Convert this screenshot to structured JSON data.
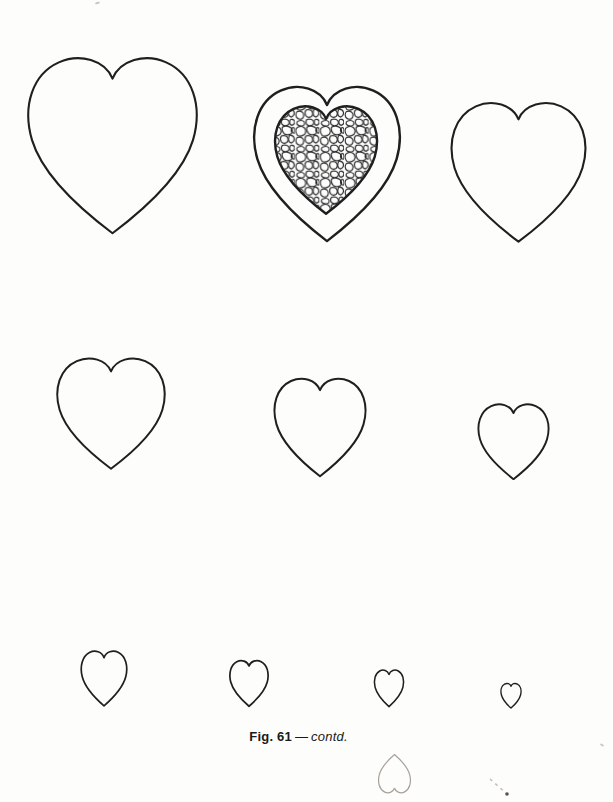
{
  "page": {
    "background": "#fdfdfc",
    "ink_color": "#1f1f1f",
    "faint_ink_color": "#a8a099"
  },
  "caption": {
    "figure_label": "Fig. 61",
    "separator": "—",
    "suffix": "contd."
  },
  "figure": {
    "hearts": [
      {
        "id": "heart-row1-1",
        "row": 1,
        "style": "outline",
        "size": "extra-large"
      },
      {
        "id": "heart-row1-2",
        "row": 1,
        "style": "double-outline-with-crackle-fill",
        "size": "large"
      },
      {
        "id": "heart-row1-3",
        "row": 1,
        "style": "outline",
        "size": "large"
      },
      {
        "id": "heart-row2-1",
        "row": 2,
        "style": "outline",
        "size": "medium-large"
      },
      {
        "id": "heart-row2-2",
        "row": 2,
        "style": "outline",
        "size": "medium"
      },
      {
        "id": "heart-row2-3",
        "row": 2,
        "style": "outline",
        "size": "medium-small"
      },
      {
        "id": "heart-row3-1",
        "row": 3,
        "style": "outline",
        "size": "small"
      },
      {
        "id": "heart-row3-2",
        "row": 3,
        "style": "outline",
        "size": "smaller"
      },
      {
        "id": "heart-row3-3",
        "row": 3,
        "style": "outline",
        "size": "tiny"
      },
      {
        "id": "heart-row3-4",
        "row": 3,
        "style": "outline",
        "size": "tiniest"
      },
      {
        "id": "heart-faint-inverted",
        "row": 4,
        "style": "faint-inverted-outline",
        "size": "tiny"
      }
    ]
  }
}
